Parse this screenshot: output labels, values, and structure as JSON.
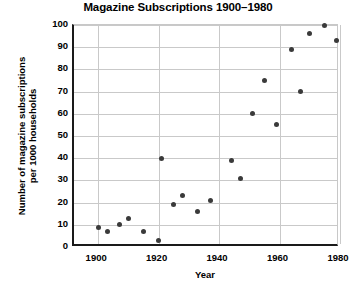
{
  "chart_data": {
    "type": "scatter",
    "title": "Magazine Subscriptions 1900–1980",
    "xlabel": "Year",
    "ylabel": "Number of magazine subscriptions\nper 1000 households",
    "ylabel_line1": "Number of magazine subscriptions",
    "ylabel_line2": "per 1000 households",
    "xlim": [
      1892,
      1980
    ],
    "ylim": [
      0,
      100
    ],
    "xticks": [
      1900,
      1920,
      1940,
      1960,
      1980
    ],
    "yticks": [
      0,
      10,
      20,
      30,
      40,
      50,
      60,
      70,
      80,
      90,
      100
    ],
    "grid": true,
    "legend": null,
    "marker_color": "#3a3a3a",
    "points": [
      {
        "x": 1900,
        "y": 9
      },
      {
        "x": 1903,
        "y": 7
      },
      {
        "x": 1907,
        "y": 10
      },
      {
        "x": 1910,
        "y": 13
      },
      {
        "x": 1915,
        "y": 7
      },
      {
        "x": 1920,
        "y": 3
      },
      {
        "x": 1921,
        "y": 40
      },
      {
        "x": 1925,
        "y": 19
      },
      {
        "x": 1928,
        "y": 23
      },
      {
        "x": 1933,
        "y": 16
      },
      {
        "x": 1937,
        "y": 21
      },
      {
        "x": 1944,
        "y": 39
      },
      {
        "x": 1947,
        "y": 31
      },
      {
        "x": 1951,
        "y": 60
      },
      {
        "x": 1955,
        "y": 75
      },
      {
        "x": 1959,
        "y": 55
      },
      {
        "x": 1964,
        "y": 89
      },
      {
        "x": 1967,
        "y": 70
      },
      {
        "x": 1970,
        "y": 96
      },
      {
        "x": 1975,
        "y": 100
      },
      {
        "x": 1979,
        "y": 93
      }
    ]
  },
  "axis": {
    "ytick_labels": [
      "100",
      "90",
      "80",
      "70",
      "60",
      "50",
      "40",
      "30",
      "20",
      "10",
      "0"
    ],
    "xtick_labels": [
      "1900",
      "1920",
      "1940",
      "1960",
      "1980"
    ]
  }
}
